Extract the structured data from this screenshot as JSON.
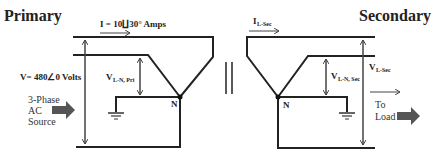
{
  "diagram": {
    "primary": {
      "title": "Primary",
      "current_label": "I = 10∐30° Amps",
      "voltage_label": "V= 480∠0 Volts",
      "vln_main": "V",
      "vln_sub": "L-N, Pri",
      "neutral": "N",
      "source_line1": "3-Phase",
      "source_line2": "AC",
      "source_line3": "Source"
    },
    "secondary": {
      "title": "Secondary",
      "current_main": "I",
      "current_sub": "L-Sec",
      "vl_main": "V",
      "vl_sub": "L-Sec",
      "vln_main": "V",
      "vln_sub": "L-N, Sec",
      "neutral": "N",
      "load_line1": "To",
      "load_line2": "Load"
    },
    "colors": {
      "wire": "#222222",
      "arrow_fill": "#555555"
    }
  }
}
